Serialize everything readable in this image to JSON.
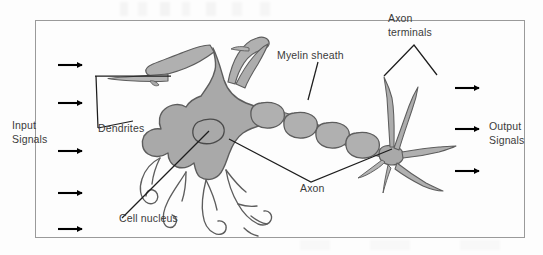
{
  "figure": {
    "frame": {
      "stroke_color": "#9a9a9a",
      "x": 35,
      "y": 20,
      "width": 490,
      "height": 218
    },
    "palette": {
      "cell_fill": "#a9a9a9",
      "cell_fill_light": "#b6b6b6",
      "outline": "#5d5d5d",
      "label_text": "#3b3b3b",
      "arrow": "#000000",
      "leader_line": "#1d1d1d",
      "background": "#fdfdfd"
    }
  },
  "labels": {
    "input_signals": "Input\nSignals",
    "input_signals_line1": "Input",
    "input_signals_line2": "Signals",
    "output_signals_line1": "Output",
    "output_signals_line2": "Signals",
    "dendrites": "Dendrites",
    "cell_nucleus": "Cell nucleus",
    "myelin_sheath": "Myelin sheath",
    "axon": "Axon",
    "axon_terminals_line1": "Axon",
    "axon_terminals_line2": "terminals"
  },
  "arrows": {
    "input": [
      {
        "name": "input-arrow-1",
        "y": 65
      },
      {
        "name": "input-arrow-2",
        "y": 103
      },
      {
        "name": "input-arrow-3",
        "y": 151
      },
      {
        "name": "input-arrow-4",
        "y": 193
      },
      {
        "name": "input-arrow-5",
        "y": 229
      }
    ],
    "output": [
      {
        "name": "output-arrow-1",
        "y": 88
      },
      {
        "name": "output-arrow-2",
        "y": 129
      },
      {
        "name": "output-arrow-3",
        "y": 171
      }
    ],
    "input_x": 58,
    "output_x": 455,
    "length": 26
  },
  "myelin_segments": [
    {
      "name": "myelin-segment-1",
      "cx": 272,
      "cy": 114
    },
    {
      "name": "myelin-segment-2",
      "cx": 305,
      "cy": 124
    },
    {
      "name": "myelin-segment-3",
      "cx": 337,
      "cy": 134
    },
    {
      "name": "myelin-segment-4",
      "cx": 367,
      "cy": 144
    }
  ],
  "parts": [
    {
      "name": "dendrites",
      "label": "Dendrites"
    },
    {
      "name": "cell-nucleus",
      "label": "Cell nucleus"
    },
    {
      "name": "soma",
      "label": "Cell body"
    },
    {
      "name": "axon",
      "label": "Axon"
    },
    {
      "name": "myelin-sheath",
      "label": "Myelin sheath"
    },
    {
      "name": "axon-terminals",
      "label": "Axon terminals"
    }
  ]
}
